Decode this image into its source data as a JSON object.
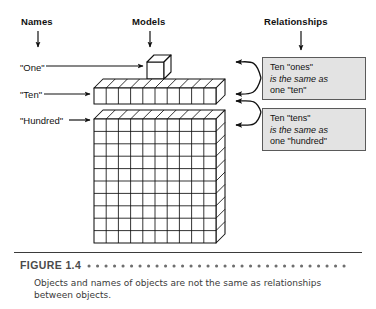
{
  "figure": {
    "number_label": "FIGURE 1.4",
    "caption": "Objects and names of objects are not the same as relationships between objects."
  },
  "columns": {
    "names_header": "Names",
    "models_header": "Models",
    "relationships_header": "Relationships"
  },
  "names": {
    "one": "\"One\"",
    "ten": "\"Ten\"",
    "hundred": "\"Hundred\""
  },
  "relationships": [
    {
      "line1": "Ten \"ones\"",
      "line2": "is the same as",
      "line3": "one \"ten\""
    },
    {
      "line1": "Ten \"tens\"",
      "line2": "is the same as",
      "line3": "one \"hundred\""
    }
  ],
  "models": {
    "unit_cube_name": "unit-cube",
    "ten_rod_cells": 10,
    "hundred_flat_rows": 10,
    "hundred_flat_cols": 10
  },
  "colors": {
    "ink": "#1a1a1a",
    "box_fill": "#e3e3e3",
    "box_border": "#5a5a5a",
    "caption_gray": "#4a4a4a",
    "rule": "#3b3b3b",
    "model_fill": "#ffffff"
  }
}
